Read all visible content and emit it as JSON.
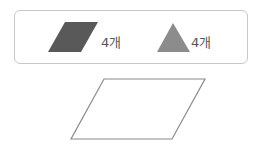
{
  "legend": {
    "items": [
      {
        "shape": "parallelogram",
        "color": "#595959",
        "count_label": "4개"
      },
      {
        "shape": "triangle",
        "color": "#8c8c8c",
        "count_label": "4개"
      }
    ]
  },
  "figure": {
    "shape": "parallelogram",
    "stroke": "#8a8a8a",
    "fill": "#ffffff"
  }
}
